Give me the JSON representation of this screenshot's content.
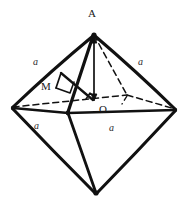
{
  "figure": {
    "shape": "octahedron",
    "background_color": "#ffffff",
    "stroke_color": "#111111",
    "label_color": "#1a1a1a"
  },
  "vertices": {
    "apex_top": {
      "label": "A",
      "x": 94,
      "y": 33
    },
    "center": {
      "label": "O",
      "x": 96,
      "y": 100
    },
    "midpoint": {
      "label": "M",
      "x": 62,
      "y": 88
    },
    "left": {
      "label": "",
      "x": 12,
      "y": 108
    },
    "right": {
      "label": "",
      "x": 176,
      "y": 110
    },
    "front": {
      "label": "",
      "x": 68,
      "y": 112
    },
    "back": {
      "label": "",
      "x": 127,
      "y": 95
    },
    "apex_bottom": {
      "label": "",
      "x": 96,
      "y": 194
    }
  },
  "vertex_labels": [
    {
      "name": "label-A",
      "text": "A",
      "x": 88,
      "y": 8
    },
    {
      "name": "label-O",
      "text": "O",
      "x": 99,
      "y": 104
    },
    {
      "name": "label-M",
      "text": "M",
      "x": 41,
      "y": 81
    }
  ],
  "edge_labels": [
    {
      "name": "edge-label-upper-left",
      "text": "a",
      "x": 33,
      "y": 57
    },
    {
      "name": "edge-label-upper-right",
      "text": "a",
      "x": 138,
      "y": 57
    },
    {
      "name": "edge-label-lower-left",
      "text": "a",
      "x": 34,
      "y": 121
    },
    {
      "name": "edge-label-lower-right",
      "text": "a",
      "x": 109,
      "y": 123
    }
  ],
  "annotations": {
    "height_segment": "A-O vertical altitude with arrowheads",
    "right_angle_marker": "right angle at M between MO and edge",
    "hidden_edges_style": "dashed"
  }
}
